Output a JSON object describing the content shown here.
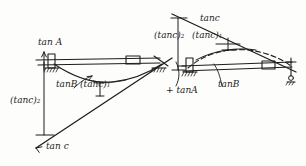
{
  "diagram": {
    "type": "hand-drawn structural beam deflection diagram",
    "ink_color": "#1d1d1d",
    "paper_color": "#fdfdfc",
    "left_structure": {
      "name": "left-beam-assembly",
      "labels": {
        "tan_a": "tan A",
        "tan_b": "tanB",
        "tan_c_paren_inline": "(tanc)",
        "tan_c_paren_vertical": "(tanc)",
        "tan_c_bottom": "tan c"
      }
    },
    "right_structure": {
      "name": "right-beam-assembly",
      "labels": {
        "tan_c_top": "tanc",
        "tan_c_paren_left": "(tanc)",
        "tan_c_paren_right": "(tanc)",
        "plus_tan_a": "+ tanA",
        "tan_b": "tanB"
      }
    },
    "subscripts": {
      "c_sub_left": "2",
      "c_sub_inline": "1",
      "c_sub_right_a": "2",
      "c_sub_right_b": "1"
    }
  }
}
